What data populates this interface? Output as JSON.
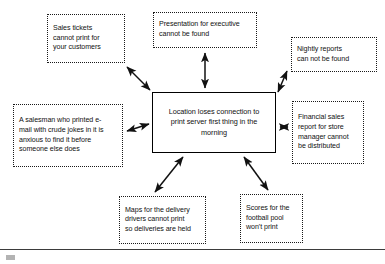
{
  "diagram": {
    "type": "cause-and-effect-fishbone",
    "title_text": "",
    "effect": {
      "id": "center",
      "name": "central-effect-box",
      "style": "solid-border",
      "lines": [
        "Location loses connection to",
        "print server first thing in the",
        "morning"
      ]
    },
    "causes": [
      {
        "id": "sales-tickets",
        "name": "cause-box-sales-tickets",
        "position": "top-left",
        "style": "dotted-border",
        "lines": [
          "Sales tickets",
          "cannot print for",
          "your customers"
        ]
      },
      {
        "id": "presentation",
        "name": "cause-box-presentation",
        "position": "top-center",
        "style": "dotted-border",
        "lines": [
          "Presentation for executive",
          "cannot be found"
        ]
      },
      {
        "id": "nightly-reports",
        "name": "cause-box-nightly-reports",
        "position": "top-right",
        "style": "dotted-border",
        "lines": [
          "Nightly reports",
          "can not be found"
        ]
      },
      {
        "id": "salesman-email",
        "name": "cause-box-salesman-email",
        "position": "left",
        "style": "dotted-border",
        "lines": [
          "A salesman who printed e-",
          "mail with crude jokes in it is",
          "anxious to find it before",
          "someone else does"
        ]
      },
      {
        "id": "financial-sales",
        "name": "cause-box-financial-sales-report",
        "position": "right",
        "style": "dotted-border",
        "lines": [
          "Financial sales",
          "report for store",
          "manager cannot",
          "be distributed"
        ]
      },
      {
        "id": "maps-delivery",
        "name": "cause-box-maps-delivery",
        "position": "bottom-left",
        "style": "dotted-border",
        "lines": [
          "Maps for the delivery",
          "drivers cannot print",
          "so deliveries are held"
        ]
      },
      {
        "id": "football-pool",
        "name": "cause-box-football-pool",
        "position": "bottom-right",
        "style": "dotted-border",
        "lines": [
          "Scores for the",
          "football pool",
          "won't print"
        ]
      }
    ],
    "connectors": [
      {
        "id": "conn-sales-tickets",
        "from": "sales-tickets",
        "to": "center",
        "arrowheads": "double",
        "orientation": "diagonal"
      },
      {
        "id": "conn-presentation",
        "from": "presentation",
        "to": "center",
        "arrowheads": "double",
        "orientation": "vertical"
      },
      {
        "id": "conn-nightly-reports",
        "from": "nightly-reports",
        "to": "center",
        "arrowheads": "double",
        "orientation": "diagonal"
      },
      {
        "id": "conn-salesman-email",
        "from": "salesman-email",
        "to": "center",
        "arrowheads": "double",
        "orientation": "horizontal"
      },
      {
        "id": "conn-financial-sales",
        "from": "financial-sales",
        "to": "center",
        "arrowheads": "double",
        "orientation": "horizontal"
      },
      {
        "id": "conn-maps-delivery",
        "from": "maps-delivery",
        "to": "center",
        "arrowheads": "double",
        "orientation": "diagonal"
      },
      {
        "id": "conn-football-pool",
        "from": "football-pool",
        "to": "center",
        "arrowheads": "double",
        "orientation": "diagonal"
      }
    ],
    "colors": {
      "box_border_solid": "#000000",
      "box_border_dotted": "#1a1a1a",
      "text": "#111111",
      "arrow": "#111111",
      "background": "#ffffff",
      "footer_rule": "#3b3b3b"
    }
  }
}
